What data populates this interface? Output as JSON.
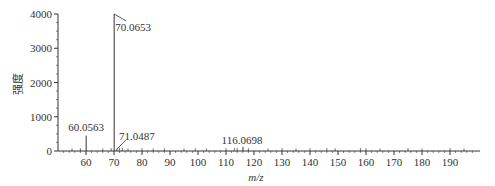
{
  "chart_data": {
    "type": "bar",
    "title": "",
    "xlabel": "m/z",
    "ylabel": "强度",
    "xlim": [
      50,
      200
    ],
    "ylim": [
      0,
      4000
    ],
    "xticks": [
      60,
      70,
      80,
      90,
      100,
      110,
      120,
      130,
      140,
      150,
      160,
      170,
      180,
      190
    ],
    "yticks": [
      0,
      1000,
      2000,
      3000,
      4000
    ],
    "grid": false,
    "legend": null,
    "peaks": [
      {
        "mz": 60.0563,
        "intensity": 450,
        "label": "60.0563"
      },
      {
        "mz": 70.0653,
        "intensity": 4000,
        "label": "70.0653"
      },
      {
        "mz": 71.0487,
        "intensity": 60,
        "label": "71.0487"
      },
      {
        "mz": 116.0698,
        "intensity": 120,
        "label": "116.0698"
      }
    ],
    "minor_peaks": [
      {
        "mz": 55,
        "intensity": 15
      },
      {
        "mz": 58,
        "intensity": 20
      },
      {
        "mz": 66,
        "intensity": 15
      },
      {
        "mz": 69,
        "intensity": 25
      },
      {
        "mz": 72,
        "intensity": 40
      },
      {
        "mz": 73,
        "intensity": 30
      },
      {
        "mz": 75,
        "intensity": 15
      },
      {
        "mz": 80,
        "intensity": 20
      },
      {
        "mz": 84,
        "intensity": 15
      },
      {
        "mz": 88,
        "intensity": 18
      },
      {
        "mz": 95,
        "intensity": 15
      },
      {
        "mz": 99,
        "intensity": 20
      },
      {
        "mz": 103,
        "intensity": 15
      },
      {
        "mz": 110,
        "intensity": 20
      },
      {
        "mz": 113,
        "intensity": 25
      },
      {
        "mz": 114,
        "intensity": 30
      },
      {
        "mz": 118,
        "intensity": 20
      },
      {
        "mz": 125,
        "intensity": 15
      },
      {
        "mz": 130,
        "intensity": 25
      },
      {
        "mz": 135,
        "intensity": 15
      },
      {
        "mz": 140,
        "intensity": 20
      },
      {
        "mz": 146,
        "intensity": 25
      },
      {
        "mz": 149,
        "intensity": 20
      },
      {
        "mz": 158,
        "intensity": 25
      },
      {
        "mz": 160,
        "intensity": 20
      },
      {
        "mz": 165,
        "intensity": 15
      },
      {
        "mz": 175,
        "intensity": 30
      },
      {
        "mz": 180,
        "intensity": 15
      },
      {
        "mz": 190,
        "intensity": 25
      },
      {
        "mz": 195,
        "intensity": 15
      }
    ],
    "annotations": [
      {
        "text": "70.0653",
        "target_mz": 70.0653
      },
      {
        "text": "71.0487",
        "target_mz": 71.0487
      },
      {
        "text": "60.0563",
        "target_mz": 60.0563
      },
      {
        "text": "116.0698",
        "target_mz": 116.0698
      }
    ]
  },
  "colors": {
    "axis": "#333333",
    "peak": "#333333",
    "text": "#333333"
  }
}
